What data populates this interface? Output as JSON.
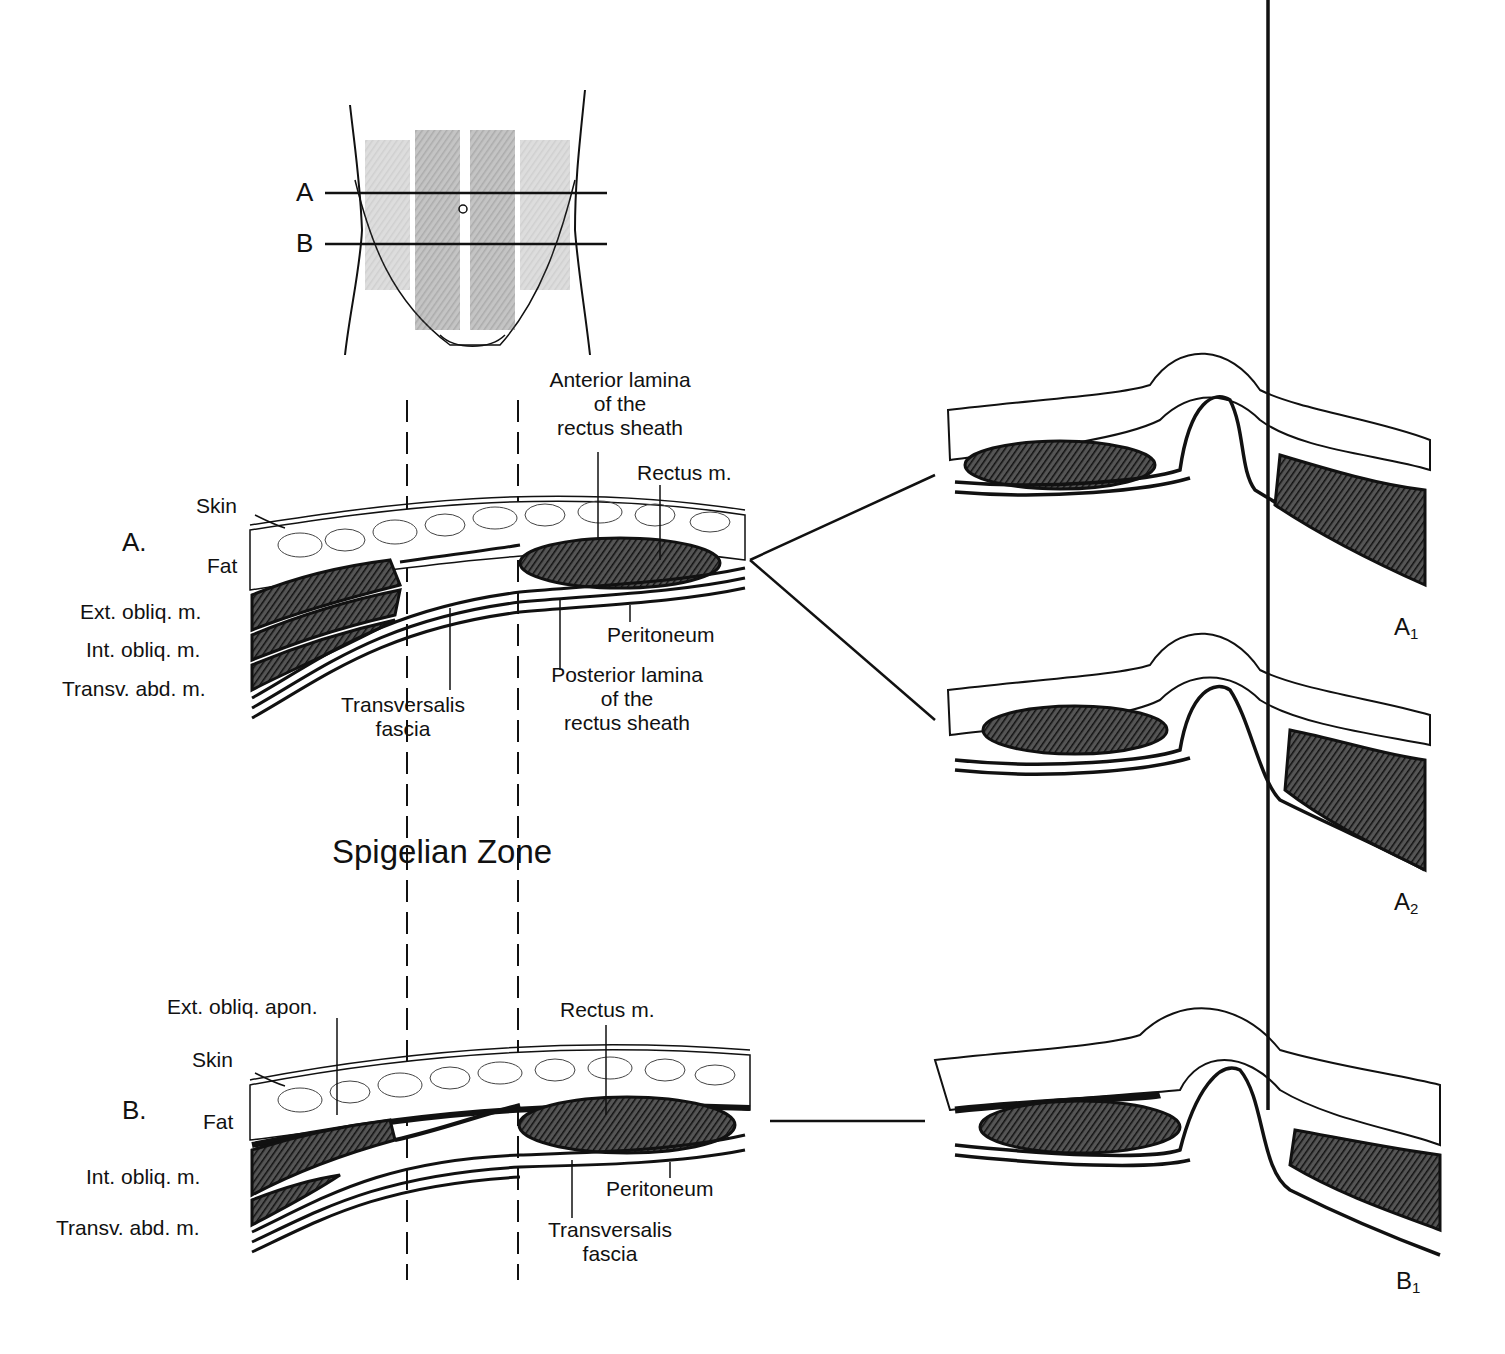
{
  "figure": {
    "title": "Spigelian Zone",
    "torso_inset": {
      "line_labels": [
        "A",
        "B"
      ]
    },
    "section_a": {
      "marker": "A.",
      "labels": {
        "skin": "Skin",
        "fat": "Fat",
        "ext_obliq": "Ext. obliq. m.",
        "int_obliq": "Int. obliq. m.",
        "transv_abd": "Transv. abd. m.",
        "transversalis_1": "Transversalis",
        "transversalis_2": "fascia",
        "anterior_1": "Anterior lamina",
        "anterior_2": "of the",
        "anterior_3": "rectus sheath",
        "rectus": "Rectus m.",
        "peritoneum": "Peritoneum",
        "posterior_1": "Posterior lamina",
        "posterior_2": "of the",
        "posterior_3": "rectus sheath"
      }
    },
    "section_b": {
      "marker": "B.",
      "labels": {
        "ext_obliq_apon": "Ext. obliq. apon.",
        "skin": "Skin",
        "fat": "Fat",
        "int_obliq": "Int. obliq. m.",
        "transv_abd": "Transv. abd. m.",
        "rectus": "Rectus m.",
        "peritoneum": "Peritoneum",
        "transversalis_1": "Transversalis",
        "transversalis_2": "fascia"
      }
    },
    "hernia_panels": [
      {
        "letter": "A",
        "sub": "1"
      },
      {
        "letter": "A",
        "sub": "2"
      },
      {
        "letter": "B",
        "sub": "1"
      }
    ],
    "colors": {
      "ink": "#111111",
      "muscle": "#3a3a3a",
      "background": "#ffffff"
    }
  }
}
